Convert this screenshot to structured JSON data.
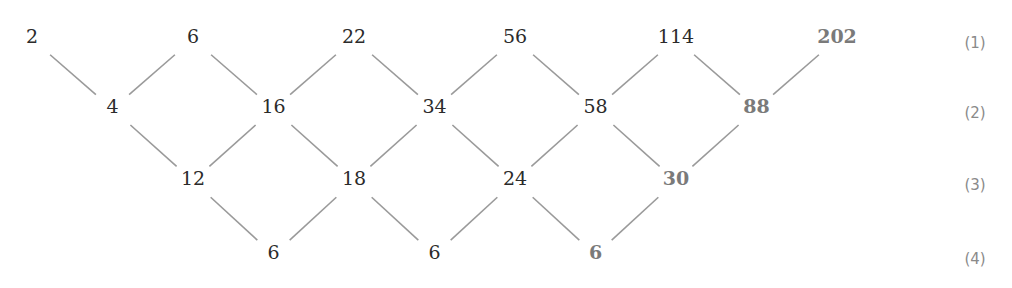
{
  "diagram": {
    "type": "difference-table",
    "rows": [
      {
        "label": "(1)",
        "values": [
          2,
          6,
          22,
          56,
          114,
          202
        ],
        "predicted": [
          false,
          false,
          false,
          false,
          false,
          true
        ]
      },
      {
        "label": "(2)",
        "values": [
          4,
          16,
          34,
          58,
          88
        ],
        "predicted": [
          false,
          false,
          false,
          false,
          true
        ]
      },
      {
        "label": "(3)",
        "values": [
          12,
          18,
          24,
          30
        ],
        "predicted": [
          false,
          false,
          false,
          true
        ]
      },
      {
        "label": "(4)",
        "values": [
          6,
          6,
          6
        ],
        "predicted": [
          false,
          false,
          true
        ]
      }
    ],
    "colors": {
      "given": "#2b2b2b",
      "predicted": "#7a7a7a",
      "edge": "#9a9a9a",
      "label": "#8a8a8a"
    }
  }
}
